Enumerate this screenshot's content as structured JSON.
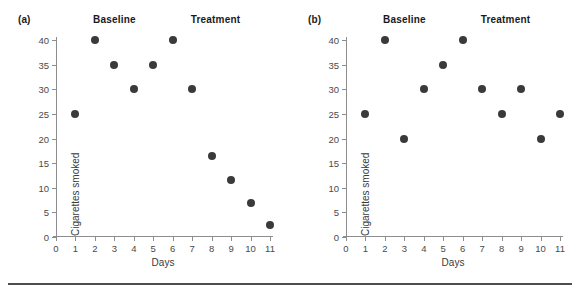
{
  "figure": {
    "panels": [
      {
        "key": "a",
        "label": "(a)",
        "phase_labels": [
          {
            "text": "Baseline",
            "at_day": 3
          },
          {
            "text": "Treatment",
            "at_day": 8.2
          }
        ]
      },
      {
        "key": "b",
        "label": "(b)",
        "phase_labels": [
          {
            "text": "Baseline",
            "at_day": 3
          },
          {
            "text": "Treatment",
            "at_day": 8.2
          }
        ]
      }
    ],
    "marker_color": "#3a3a3a",
    "axis_color": "#8d8d8d"
  },
  "chart_data": [
    {
      "type": "scatter",
      "panel": "(a)",
      "title": "",
      "xlabel": "Days",
      "ylabel": "Cigarettes smoked",
      "xlim": [
        0,
        11
      ],
      "ylim": [
        0,
        40
      ],
      "xticks": [
        0,
        1,
        2,
        3,
        4,
        5,
        6,
        7,
        8,
        9,
        10,
        11
      ],
      "yticks": [
        0,
        5,
        10,
        15,
        20,
        25,
        30,
        35,
        40
      ],
      "grid": false,
      "legend": "none",
      "annotations": [
        "Baseline",
        "Treatment"
      ],
      "phase_change_between_days": [
        6,
        7
      ],
      "x": [
        1,
        2,
        3,
        4,
        5,
        6,
        7,
        8,
        9,
        10,
        11
      ],
      "values": [
        25,
        40,
        35,
        30,
        35,
        40,
        30,
        16.5,
        11.5,
        7,
        2.5
      ]
    },
    {
      "type": "scatter",
      "panel": "(b)",
      "title": "",
      "xlabel": "Days",
      "ylabel": "Cigarettes smoked",
      "xlim": [
        0,
        11
      ],
      "ylim": [
        0,
        40
      ],
      "xticks": [
        0,
        1,
        2,
        3,
        4,
        5,
        6,
        7,
        8,
        9,
        10,
        11
      ],
      "yticks": [
        0,
        5,
        10,
        15,
        20,
        25,
        30,
        35,
        40
      ],
      "grid": false,
      "legend": "none",
      "annotations": [
        "Baseline",
        "Treatment"
      ],
      "phase_change_between_days": [
        6,
        7
      ],
      "x": [
        1,
        2,
        3,
        4,
        5,
        6,
        7,
        8,
        9,
        10,
        11
      ],
      "values": [
        25,
        40,
        20,
        30,
        35,
        40,
        30,
        25,
        30,
        20,
        25
      ]
    }
  ]
}
